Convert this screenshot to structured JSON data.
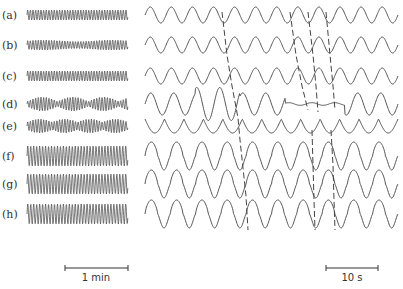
{
  "figure": {
    "panels": [
      "(a)",
      "(b)",
      "(c)",
      "(d)",
      "(e)",
      "(f)",
      "(g)",
      "(h)"
    ],
    "left_scale_bar": "1 min",
    "right_scale_bar": "10 s",
    "line_color": "#555555"
  },
  "chart_data": {
    "type": "line",
    "title": "",
    "series": [
      {
        "name": "(a)",
        "left": {
          "pattern": "regular fast oscillation",
          "amplitude": "small"
        },
        "right": {
          "cycles": 12,
          "waveform": "regular sinusoid"
        }
      },
      {
        "name": "(b)",
        "left": {
          "pattern": "regular oscillation, slight modulation",
          "amplitude": "small"
        },
        "right": {
          "cycles": 12,
          "waveform": "regular sinusoid"
        }
      },
      {
        "name": "(c)",
        "left": {
          "pattern": "regular oscillation",
          "amplitude": "small"
        },
        "right": {
          "cycles": 12,
          "waveform": "regular sinusoid"
        }
      },
      {
        "name": "(d)",
        "left": {
          "pattern": "irregular bursting / waxing-waning",
          "amplitude": "variable"
        },
        "right": {
          "cycles": 11,
          "waveform": "irregular, large spikes then flat segment then recovery"
        }
      },
      {
        "name": "(e)",
        "left": {
          "pattern": "periodic amplitude modulation (bursts)",
          "amplitude": "medium"
        },
        "right": {
          "cycles": 13,
          "waveform": "cusped oscillation"
        }
      },
      {
        "name": "(f)",
        "left": {
          "pattern": "large regular oscillation with grouping",
          "amplitude": "large"
        },
        "right": {
          "cycles": 10,
          "waveform": "large asymmetric peaks"
        }
      },
      {
        "name": "(g)",
        "left": {
          "pattern": "large regular oscillation",
          "amplitude": "large"
        },
        "right": {
          "cycles": 10,
          "waveform": "large asymmetric peaks"
        }
      },
      {
        "name": "(h)",
        "left": {
          "pattern": "large regular oscillation with grouping",
          "amplitude": "large"
        },
        "right": {
          "cycles": 10,
          "waveform": "large asymmetric peaks"
        }
      }
    ],
    "annotations": [
      "1 min",
      "10 s"
    ],
    "grid": false,
    "legend": "none"
  }
}
